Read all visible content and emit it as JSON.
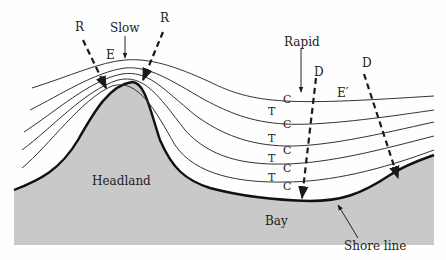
{
  "diagram": {
    "colors": {
      "land": "#c9c9c9",
      "shore": "#111111",
      "crest": "#333333",
      "ray": "#1a1a1a",
      "background": "#fefefe"
    },
    "labels": {
      "ray_left": "R",
      "ray_right": "R",
      "slow": "Slow",
      "energy_concentrated": "E",
      "rapid": "Rapid",
      "ray_d1": "D",
      "ray_d2": "D",
      "energy_dispersed": "E′",
      "headland": "Headland",
      "bay": "Bay",
      "shore_line": "Shore line",
      "trough_labels": [
        "T",
        "T",
        "T",
        "T"
      ],
      "crest_labels": [
        "C",
        "C",
        "C",
        "C",
        "C"
      ]
    }
  }
}
